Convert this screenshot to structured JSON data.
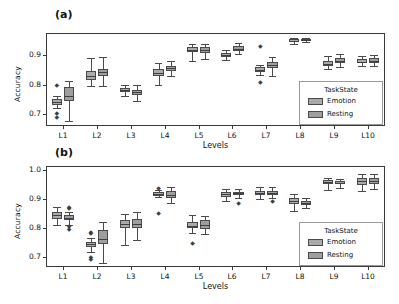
{
  "figure": {
    "background": "#ffffff",
    "colors": {
      "emotion": "#aaaaaa",
      "resting": "#9e9e9e",
      "line": "#4a4a4a",
      "frame": "#3a3a3a"
    }
  },
  "panels": [
    {
      "tag": "(a)",
      "chart_data": {
        "type": "box",
        "title": "",
        "xlabel": "Levels",
        "ylabel": "Accuracy",
        "categories": [
          "L1",
          "L2",
          "L3",
          "L4",
          "L5",
          "L6",
          "L7",
          "L8",
          "L9",
          "L10"
        ],
        "ylim": [
          0.66,
          0.975
        ],
        "yticks": [
          0.7,
          0.8,
          0.9
        ],
        "ytick_labels": [
          "0.7",
          "0.8",
          "0.9"
        ],
        "grid": false,
        "legend": {
          "title": "TaskState",
          "position": "lower-right",
          "entries": [
            "Emotion",
            "Resting"
          ]
        },
        "series": [
          {
            "name": "Emotion",
            "boxes": [
              {
                "category": "L1",
                "whislo": 0.722,
                "q1": 0.731,
                "med": 0.741,
                "q3": 0.75,
                "whishi": 0.762,
                "fliers": [
                  0.798,
                  0.704,
                  0.691
                ]
              },
              {
                "category": "L2",
                "whislo": 0.795,
                "q1": 0.815,
                "med": 0.828,
                "q3": 0.845,
                "whishi": 0.892,
                "fliers": []
              },
              {
                "category": "L3",
                "whislo": 0.763,
                "q1": 0.774,
                "med": 0.781,
                "q3": 0.789,
                "whishi": 0.8,
                "fliers": []
              },
              {
                "category": "L4",
                "whislo": 0.8,
                "q1": 0.831,
                "med": 0.841,
                "q3": 0.854,
                "whishi": 0.872,
                "fliers": []
              },
              {
                "category": "L5",
                "whislo": 0.88,
                "q1": 0.91,
                "med": 0.919,
                "q3": 0.926,
                "whishi": 0.937,
                "fliers": []
              },
              {
                "category": "L6",
                "whislo": 0.884,
                "q1": 0.893,
                "med": 0.899,
                "q3": 0.906,
                "whishi": 0.916,
                "fliers": []
              },
              {
                "category": "L7",
                "whislo": 0.834,
                "q1": 0.843,
                "med": 0.85,
                "q3": 0.859,
                "whishi": 0.868,
                "fliers": [
                  0.93,
                  0.808
                ]
              },
              {
                "category": "L8",
                "whislo": 0.938,
                "q1": 0.944,
                "med": 0.949,
                "q3": 0.953,
                "whishi": 0.959,
                "fliers": []
              },
              {
                "category": "L9",
                "whislo": 0.853,
                "q1": 0.862,
                "med": 0.87,
                "q3": 0.881,
                "whishi": 0.898,
                "fliers": []
              },
              {
                "category": "L10",
                "whislo": 0.862,
                "q1": 0.874,
                "med": 0.878,
                "q3": 0.886,
                "whishi": 0.898,
                "fliers": []
              }
            ]
          },
          {
            "name": "Resting",
            "boxes": [
              {
                "category": "L1",
                "whislo": 0.676,
                "q1": 0.746,
                "med": 0.762,
                "q3": 0.791,
                "whishi": 0.812,
                "fliers": []
              },
              {
                "category": "L2",
                "whislo": 0.795,
                "q1": 0.83,
                "med": 0.844,
                "q3": 0.854,
                "whishi": 0.893,
                "fliers": []
              },
              {
                "category": "L3",
                "whislo": 0.745,
                "q1": 0.765,
                "med": 0.775,
                "q3": 0.783,
                "whishi": 0.8,
                "fliers": []
              },
              {
                "category": "L4",
                "whislo": 0.831,
                "q1": 0.847,
                "med": 0.855,
                "q3": 0.864,
                "whishi": 0.879,
                "fliers": []
              },
              {
                "category": "L5",
                "whislo": 0.888,
                "q1": 0.908,
                "med": 0.916,
                "q3": 0.927,
                "whishi": 0.937,
                "fliers": []
              },
              {
                "category": "L6",
                "whislo": 0.903,
                "q1": 0.914,
                "med": 0.922,
                "q3": 0.93,
                "whishi": 0.94,
                "fliers": []
              },
              {
                "category": "L7",
                "whislo": 0.831,
                "q1": 0.857,
                "med": 0.868,
                "q3": 0.878,
                "whishi": 0.893,
                "fliers": []
              },
              {
                "category": "L8",
                "whislo": 0.944,
                "q1": 0.947,
                "med": 0.95,
                "q3": 0.954,
                "whishi": 0.957,
                "fliers": []
              },
              {
                "category": "L9",
                "whislo": 0.859,
                "q1": 0.872,
                "med": 0.88,
                "q3": 0.889,
                "whishi": 0.903,
                "fliers": []
              },
              {
                "category": "L10",
                "whislo": 0.862,
                "q1": 0.873,
                "med": 0.881,
                "q3": 0.89,
                "whishi": 0.899,
                "fliers": []
              }
            ]
          }
        ]
      }
    },
    {
      "tag": "(b)",
      "chart_data": {
        "type": "box",
        "title": "",
        "xlabel": "Levels",
        "ylabel": "Accuracy",
        "categories": [
          "L1",
          "L2",
          "L3",
          "L4",
          "L5",
          "L6",
          "L7",
          "L8",
          "L9",
          "L10"
        ],
        "ylim": [
          0.665,
          1.015
        ],
        "yticks": [
          0.7,
          0.8,
          0.9,
          1.0
        ],
        "ytick_labels": [
          "0.7",
          "0.8",
          "0.9",
          "1.0"
        ],
        "grid": false,
        "legend": {
          "title": "TaskState",
          "position": "lower-right",
          "entries": [
            "Emotion",
            "Resting"
          ]
        },
        "series": [
          {
            "name": "Emotion",
            "boxes": [
              {
                "category": "L1",
                "whislo": 0.812,
                "q1": 0.832,
                "med": 0.845,
                "q3": 0.856,
                "whishi": 0.872,
                "fliers": []
              },
              {
                "category": "L2",
                "whislo": 0.718,
                "q1": 0.735,
                "med": 0.743,
                "q3": 0.752,
                "whishi": 0.765,
                "fliers": [
                  0.787,
                  0.782,
                  0.7,
                  0.691
                ]
              },
              {
                "category": "L3",
                "whislo": 0.74,
                "q1": 0.801,
                "med": 0.814,
                "q3": 0.827,
                "whishi": 0.848,
                "fliers": []
              },
              {
                "category": "L4",
                "whislo": 0.906,
                "q1": 0.912,
                "med": 0.918,
                "q3": 0.924,
                "whishi": 0.932,
                "fliers": [
                  0.938,
                  0.852
                ]
              },
              {
                "category": "L5",
                "whislo": 0.782,
                "q1": 0.799,
                "med": 0.808,
                "q3": 0.82,
                "whishi": 0.845,
                "fliers": [
                  0.747
                ]
              },
              {
                "category": "L6",
                "whislo": 0.895,
                "q1": 0.908,
                "med": 0.917,
                "q3": 0.925,
                "whishi": 0.934,
                "fliers": []
              },
              {
                "category": "L7",
                "whislo": 0.901,
                "q1": 0.913,
                "med": 0.921,
                "q3": 0.929,
                "whishi": 0.941,
                "fliers": []
              },
              {
                "category": "L8",
                "whislo": 0.86,
                "q1": 0.884,
                "med": 0.894,
                "q3": 0.903,
                "whishi": 0.919,
                "fliers": []
              },
              {
                "category": "L9",
                "whislo": 0.932,
                "q1": 0.951,
                "med": 0.958,
                "q3": 0.966,
                "whishi": 0.975,
                "fliers": []
              },
              {
                "category": "L10",
                "whislo": 0.93,
                "q1": 0.948,
                "med": 0.962,
                "q3": 0.973,
                "whishi": 0.986,
                "fliers": []
              }
            ]
          },
          {
            "name": "Resting",
            "boxes": [
              {
                "category": "L1",
                "whislo": 0.81,
                "q1": 0.828,
                "med": 0.836,
                "q3": 0.845,
                "whishi": 0.855,
                "fliers": [
                  0.873,
                  0.868,
                  0.806,
                  0.797
                ]
              },
              {
                "category": "L2",
                "whislo": 0.678,
                "q1": 0.745,
                "med": 0.762,
                "q3": 0.793,
                "whishi": 0.82,
                "fliers": []
              },
              {
                "category": "L3",
                "whislo": 0.758,
                "q1": 0.799,
                "med": 0.813,
                "q3": 0.83,
                "whishi": 0.857,
                "fliers": []
              },
              {
                "category": "L4",
                "whislo": 0.888,
                "q1": 0.905,
                "med": 0.914,
                "q3": 0.928,
                "whishi": 0.942,
                "fliers": []
              },
              {
                "category": "L5",
                "whislo": 0.781,
                "q1": 0.798,
                "med": 0.811,
                "q3": 0.828,
                "whishi": 0.842,
                "fliers": []
              },
              {
                "category": "L6",
                "whislo": 0.904,
                "q1": 0.913,
                "med": 0.92,
                "q3": 0.926,
                "whishi": 0.934,
                "fliers": [
                  0.886
                ]
              },
              {
                "category": "L7",
                "whislo": 0.903,
                "q1": 0.915,
                "med": 0.922,
                "q3": 0.93,
                "whishi": 0.941,
                "fliers": [
                  0.892
                ]
              },
              {
                "category": "L8",
                "whislo": 0.868,
                "q1": 0.879,
                "med": 0.886,
                "q3": 0.893,
                "whishi": 0.903,
                "fliers": []
              },
              {
                "category": "L9",
                "whislo": 0.938,
                "q1": 0.951,
                "med": 0.956,
                "q3": 0.962,
                "whishi": 0.97,
                "fliers": []
              },
              {
                "category": "L10",
                "whislo": 0.934,
                "q1": 0.952,
                "med": 0.962,
                "q3": 0.974,
                "whishi": 0.986,
                "fliers": []
              }
            ]
          }
        ]
      }
    }
  ]
}
